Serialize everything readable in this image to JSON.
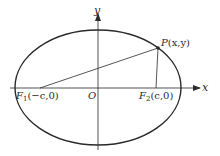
{
  "diagram": {
    "title": "",
    "axes": {
      "x_label": "x",
      "y_label": "y",
      "origin_label": "O"
    },
    "ellipse": {
      "cx": 98,
      "cy": 87.5,
      "rx": 83,
      "ry": 57.5
    },
    "points": {
      "F1": {
        "name": "F",
        "sub": "1",
        "coords": "(−c,0)",
        "x": 40,
        "y": 88
      },
      "F2": {
        "name": "F",
        "sub": "2",
        "coords": "(c,0)",
        "x": 156,
        "y": 88
      },
      "P": {
        "name": "P",
        "coords": "(x,y)",
        "x": 158,
        "y": 48
      }
    },
    "segments": [
      {
        "from": "F1",
        "to": "P"
      },
      {
        "from": "F2",
        "to": "P"
      }
    ],
    "colors": {
      "stroke": "#2a2a2a",
      "background": "#ffffff"
    }
  }
}
